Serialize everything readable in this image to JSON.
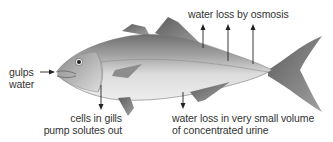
{
  "diagram": {
    "labels": {
      "gulps_water": {
        "line1": "gulps",
        "line2": "water"
      },
      "water_loss_osmosis": {
        "text": "water loss by osmosis"
      },
      "cells_in_gills": {
        "line1": "cells in gills",
        "line2": "pump solutes out"
      },
      "urine": {
        "line1": "water loss in very small volume",
        "line2": "of concentrated urine"
      }
    },
    "colors": {
      "background": "#ffffff",
      "text": "#333333",
      "arrow": "#222222",
      "fish_back": "#7a7a7a",
      "fish_belly": "#e6e6e6",
      "fin": "#8a8a8a"
    }
  }
}
